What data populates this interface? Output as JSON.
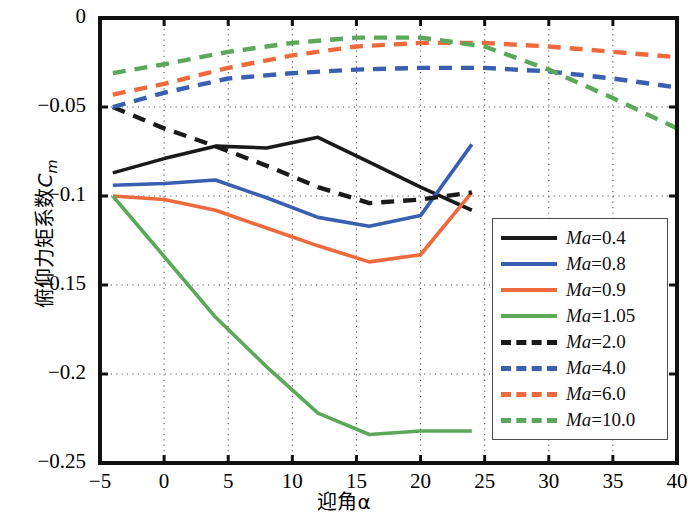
{
  "chart_data": {
    "type": "line",
    "title": "",
    "xlabel": "迎角α",
    "ylabel": "俯仰力矩系数Cm",
    "xlim": [
      -5,
      40
    ],
    "ylim": [
      -0.25,
      0
    ],
    "xticks": [
      -5,
      0,
      5,
      10,
      15,
      20,
      25,
      30,
      35,
      40
    ],
    "yticks": [
      0,
      -0.05,
      -0.1,
      -0.15,
      -0.2,
      -0.25
    ],
    "xtick_labels": [
      "-5",
      "0",
      "5",
      "10",
      "15",
      "20",
      "25",
      "30",
      "35",
      "40"
    ],
    "ytick_labels": [
      "0",
      "-0.05",
      "-0.1",
      "-0.15",
      "-0.2",
      "-0.25"
    ],
    "grid": true,
    "grid_style": "dotted",
    "legend_position": "lower right",
    "series": [
      {
        "name": "Ma=0.4",
        "label_prefix": "Ma",
        "label_value": "=0.4",
        "color": "#1a1a1a",
        "style": "solid",
        "x": [
          -4,
          0,
          4,
          8,
          12,
          16,
          20,
          24
        ],
        "y": [
          -0.087,
          -0.079,
          -0.072,
          -0.073,
          -0.067,
          -0.081,
          -0.095,
          -0.108
        ]
      },
      {
        "name": "Ma=0.8",
        "label_prefix": "Ma",
        "label_value": "=0.8",
        "color": "#3a5fb0",
        "style": "solid",
        "x": [
          -4,
          0,
          4,
          8,
          12,
          16,
          20,
          24
        ],
        "y": [
          -0.094,
          -0.093,
          -0.091,
          -0.101,
          -0.112,
          -0.117,
          -0.111,
          -0.071
        ]
      },
      {
        "name": "Ma=0.9",
        "label_prefix": "Ma",
        "label_value": "=0.9",
        "color": "#ee6a3c",
        "style": "solid",
        "x": [
          -4,
          0,
          4,
          8,
          12,
          16,
          20,
          24
        ],
        "y": [
          -0.1,
          -0.102,
          -0.108,
          -0.118,
          -0.128,
          -0.137,
          -0.133,
          -0.098
        ]
      },
      {
        "name": "Ma=1.05",
        "label_prefix": "Ma",
        "label_value": "=1.05",
        "color": "#5ba85b",
        "style": "solid",
        "x": [
          -4,
          0,
          4,
          8,
          12,
          16,
          20,
          24
        ],
        "y": [
          -0.1,
          -0.134,
          -0.168,
          -0.196,
          -0.222,
          -0.234,
          -0.232,
          -0.232
        ]
      },
      {
        "name": "Ma=2.0",
        "label_prefix": "Ma",
        "label_value": "=2.0",
        "color": "#1a1a1a",
        "style": "dashed",
        "x": [
          -4,
          0,
          4,
          8,
          12,
          16,
          20,
          24
        ],
        "y": [
          -0.05,
          -0.062,
          -0.072,
          -0.083,
          -0.095,
          -0.104,
          -0.102,
          -0.098
        ]
      },
      {
        "name": "Ma=4.0",
        "label_prefix": "Ma",
        "label_value": "=4.0",
        "color": "#3a5fb0",
        "style": "dashed",
        "x": [
          -4,
          0,
          5,
          10,
          15,
          20,
          25,
          30,
          35,
          40
        ],
        "y": [
          -0.05,
          -0.042,
          -0.034,
          -0.031,
          -0.029,
          -0.028,
          -0.028,
          -0.03,
          -0.034,
          -0.039
        ]
      },
      {
        "name": "Ma=6.0",
        "label_prefix": "Ma",
        "label_value": "=6.0",
        "color": "#ee6a3c",
        "style": "dashed",
        "x": [
          -4,
          0,
          5,
          10,
          15,
          20,
          25,
          30,
          35,
          40
        ],
        "y": [
          -0.043,
          -0.037,
          -0.028,
          -0.021,
          -0.016,
          -0.014,
          -0.014,
          -0.016,
          -0.019,
          -0.022
        ]
      },
      {
        "name": "Ma=10.0",
        "label_prefix": "Ma",
        "label_value": "=10.0",
        "color": "#5ba85b",
        "style": "dashed",
        "x": [
          -4,
          0,
          5,
          10,
          15,
          20,
          25,
          30,
          35,
          40
        ],
        "y": [
          -0.031,
          -0.026,
          -0.019,
          -0.014,
          -0.011,
          -0.011,
          -0.016,
          -0.029,
          -0.045,
          -0.062
        ]
      }
    ]
  },
  "axes": {
    "xlabel": "迎角α",
    "ylabel_text": "俯仰力矩系数",
    "ylabel_symbol": "C",
    "ylabel_sub": "m"
  },
  "legend": {
    "entries": [
      {
        "symbol": "Ma",
        "value": "=0.4"
      },
      {
        "symbol": "Ma",
        "value": "=0.8"
      },
      {
        "symbol": "Ma",
        "value": "=0.9"
      },
      {
        "symbol": "Ma",
        "value": "=1.05"
      },
      {
        "symbol": "Ma",
        "value": "=2.0"
      },
      {
        "symbol": "Ma",
        "value": "=4.0"
      },
      {
        "symbol": "Ma",
        "value": "=6.0"
      },
      {
        "symbol": "Ma",
        "value": "=10.0"
      }
    ]
  }
}
